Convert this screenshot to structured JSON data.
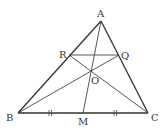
{
  "figure": {
    "points": {
      "A": {
        "label": "A",
        "x": 101,
        "y": 21,
        "lx": 97,
        "ly": 17
      },
      "B": {
        "label": "B",
        "x": 18,
        "y": 113,
        "lx": 6,
        "ly": 121
      },
      "C": {
        "label": "C",
        "x": 148,
        "y": 113,
        "lx": 151,
        "ly": 121
      },
      "M": {
        "label": "M",
        "x": 83,
        "y": 113,
        "lx": 78,
        "ly": 125
      },
      "R": {
        "label": "R",
        "x": 69,
        "y": 55,
        "lx": 59,
        "ly": 58
      },
      "Q": {
        "label": "Q",
        "x": 119,
        "y": 55,
        "lx": 121,
        "ly": 59
      },
      "O": {
        "label": "O",
        "x": 92,
        "y": 71,
        "lx": 91,
        "ly": 84
      }
    },
    "stroke_color": "#333333",
    "tick_marks": "BM = MC (double ticks)"
  }
}
